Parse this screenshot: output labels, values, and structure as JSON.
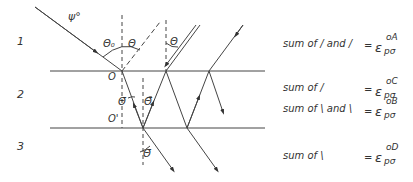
{
  "layers": [
    {
      "label": "1"
    },
    {
      "label": "2"
    },
    {
      "label": "3"
    }
  ],
  "angles": {
    "incident": "ψ°",
    "theta0": "Θ₀",
    "theta": "Θ",
    "theta_bar": "Θ̄"
  },
  "points": {
    "O": "O",
    "O_prime": "O'"
  },
  "legend": [
    {
      "text": "sum of / and /",
      "eq": "=",
      "symbol": "ε",
      "sub": "pσ",
      "sup": "oA"
    },
    {
      "text": "sum of /",
      "eq": "=",
      "symbol": "ε",
      "sub": "pσ",
      "sup": "oC"
    },
    {
      "text": "sum of \\ and \\",
      "eq": "=",
      "symbol": "ε",
      "sub": "pσ",
      "sup": "oB"
    },
    {
      "text": "sum of \\",
      "eq": "=",
      "symbol": "ε",
      "sub": "pσ",
      "sup": "oD"
    }
  ]
}
